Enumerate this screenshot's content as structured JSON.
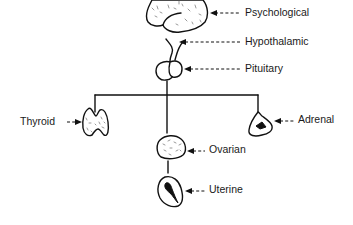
{
  "diagram": {
    "type": "factor-hierarchy",
    "nodes": [
      {
        "id": "psychological",
        "label": "Psychological",
        "icon": "brain-icon"
      },
      {
        "id": "hypothalamic",
        "label": "Hypothalamic",
        "icon": "hypothalamus-stalk-icon"
      },
      {
        "id": "pituitary",
        "label": "Pituitary",
        "icon": "pituitary-gland-icon"
      },
      {
        "id": "thyroid",
        "label": "Thyroid",
        "icon": "thyroid-gland-icon"
      },
      {
        "id": "adrenal",
        "label": "Adrenal",
        "icon": "adrenal-gland-icon"
      },
      {
        "id": "ovarian",
        "label": "Ovarian",
        "icon": "ovary-icon"
      },
      {
        "id": "uterine",
        "label": "Uterine",
        "icon": "uterus-icon"
      }
    ],
    "edges": [
      {
        "from": "pituitary",
        "to": "thyroid"
      },
      {
        "from": "pituitary",
        "to": "adrenal"
      },
      {
        "from": "pituitary",
        "to": "ovarian"
      },
      {
        "from": "ovarian",
        "to": "uterine"
      }
    ],
    "ink_color": "#111111",
    "background": "#ffffff"
  }
}
